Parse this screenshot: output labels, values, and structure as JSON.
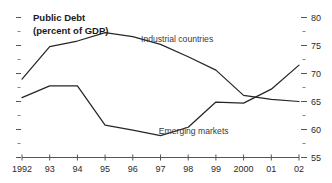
{
  "chart_data": {
    "type": "line",
    "title": "Public Debt",
    "subtitle": "(percent of GDP)",
    "xlabel": "",
    "ylabel": "",
    "grid": false,
    "legend_position": "inline-annotations",
    "y_axis_side": "right",
    "ylim": [
      55,
      80
    ],
    "y_ticks": [
      55,
      60,
      65,
      70,
      75,
      80
    ],
    "y_tick_labels": [
      "55",
      "60",
      "65",
      "70",
      "75",
      "80"
    ],
    "y_minor_ticks": [
      57.5,
      62.5,
      67.5,
      72.5,
      77.5
    ],
    "categories": [
      "1992",
      "93",
      "94",
      "95",
      "96",
      "97",
      "98",
      "99",
      "2000",
      "01",
      "02"
    ],
    "x": [
      1992,
      1993,
      1994,
      1995,
      1996,
      1997,
      1998,
      1999,
      2000,
      2001,
      2002
    ],
    "series": [
      {
        "name": "Industrial countries",
        "values": [
          69.0,
          74.8,
          75.8,
          77.3,
          76.6,
          75.2,
          73.0,
          70.6,
          66.1,
          65.4,
          65.0
        ]
      },
      {
        "name": "Emerging markets",
        "values": [
          65.7,
          67.8,
          67.8,
          60.8,
          59.9,
          58.9,
          60.4,
          64.9,
          64.7,
          67.2,
          71.5
        ]
      }
    ],
    "annotations": [
      {
        "text": "Industrial countries",
        "x": 1997.6,
        "y": 75.6
      },
      {
        "text": "Emerging markets",
        "x": 1998.2,
        "y": 59.2
      }
    ]
  },
  "colors": {
    "line": "#262626",
    "axis": "#555555",
    "text": "#1a1a1a",
    "background": "#ffffff"
  }
}
